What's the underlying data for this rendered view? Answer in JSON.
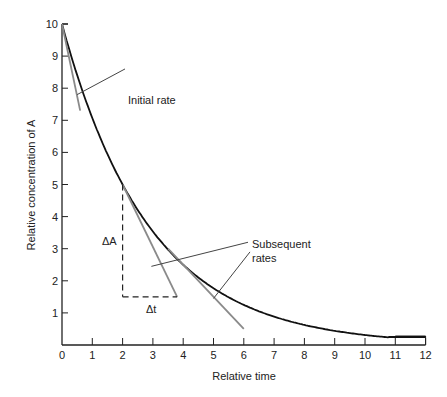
{
  "chart_data": {
    "type": "line",
    "title": "",
    "xlabel": "Relative time",
    "ylabel": "Relative concentration of A",
    "xlim": [
      0,
      12
    ],
    "ylim": [
      0,
      10
    ],
    "x_ticks": [
      "0",
      "1",
      "2",
      "3",
      "4",
      "5",
      "6",
      "7",
      "8",
      "9",
      "10",
      "11",
      "12"
    ],
    "y_ticks": [
      "1",
      "2",
      "3",
      "4",
      "5",
      "6",
      "7",
      "8",
      "9",
      "10"
    ],
    "grid": false,
    "series": [
      {
        "name": "Concentration of A (exponential decay)",
        "x": [
          0,
          0.5,
          1,
          1.5,
          2,
          2.5,
          3,
          3.5,
          4,
          5,
          6,
          7,
          8,
          9,
          10,
          11,
          12
        ],
        "values": [
          10,
          8.6,
          7.4,
          6.1,
          5.0,
          4.2,
          3.5,
          3.0,
          2.5,
          1.8,
          1.3,
          0.95,
          0.7,
          0.5,
          0.35,
          0.25,
          0.25
        ]
      }
    ],
    "tangents": [
      {
        "name": "Initial rate",
        "from": [
          0,
          10
        ],
        "to": [
          0.6,
          7.3
        ]
      },
      {
        "name": "Subsequent rate 1",
        "from": [
          2,
          5
        ],
        "to": [
          3.8,
          1.5
        ]
      },
      {
        "name": "Subsequent rate 2",
        "from": [
          3.5,
          3.0
        ],
        "to": [
          6.0,
          0.5
        ]
      }
    ],
    "delta_triangle": {
      "vertical": {
        "x": 2,
        "y_from": 5,
        "y_to": 1.5
      },
      "horizontal": {
        "y": 1.5,
        "x_from": 2,
        "x_to": 3.8
      }
    },
    "annotations": [
      {
        "text": "Initial rate",
        "at": [
          1.5,
          8.6
        ]
      },
      {
        "text": "ΔA",
        "at": [
          1.6,
          3.3
        ]
      },
      {
        "text": "Δt",
        "at": [
          2.9,
          0.8
        ]
      },
      {
        "text": "Subsequent",
        "at": [
          6.4,
          2.9
        ]
      },
      {
        "text": "rates",
        "at": [
          6.4,
          2.5
        ]
      }
    ],
    "legend": null
  },
  "labels": {
    "initial_rate": "Initial rate",
    "delta_a": "ΔA",
    "delta_t": "Δt",
    "subsequent": "Subsequent",
    "rates": "rates",
    "xlabel": "Relative time",
    "ylabel": "Relative concentration of A"
  },
  "colors": {
    "curve": "#111111",
    "tangent": "#8a8a8a",
    "axis": "#222222",
    "leader": "#444444"
  }
}
